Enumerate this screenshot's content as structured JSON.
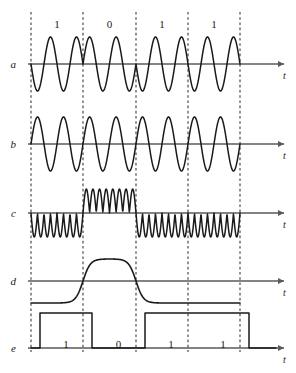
{
  "figure": {
    "title": "",
    "width": 296,
    "height": 373,
    "background": "#ffffff",
    "line_color": "#1a1a1a",
    "axis_color": "#5a5a5a",
    "dash_color": "#3a3a3a"
  },
  "timing": {
    "bit_labels": [
      "1",
      "0",
      "1",
      "1"
    ],
    "boundaries_x": [
      31,
      83,
      136,
      188,
      240
    ],
    "bit_label_y": 18,
    "axis_end_x": 284,
    "arrow_x": 278
  },
  "rows": [
    {
      "name": "a",
      "label": "a",
      "label_x": 14,
      "label_y": 58,
      "baseline_y": 64,
      "amplitude": 27,
      "t_label": "t",
      "t_x": 283,
      "t_y": 70,
      "kind": "psk",
      "cycles_per_bit": 2,
      "phases_deg": [
        180,
        0,
        180,
        180
      ]
    },
    {
      "name": "b",
      "label": "b",
      "label_x": 14,
      "label_y": 138,
      "baseline_y": 144,
      "amplitude": 27,
      "t_label": "t",
      "t_x": 283,
      "t_y": 150,
      "kind": "carrier",
      "cycles_per_bit": 2,
      "phase_deg": 0
    },
    {
      "name": "c",
      "label": "c",
      "label_x": 14,
      "label_y": 207,
      "baseline_y": 213,
      "amplitude": 24,
      "t_label": "t",
      "t_x": 283,
      "t_y": 219,
      "kind": "product",
      "cycles_per_bit": 2,
      "signs": [
        -1,
        1,
        -1,
        -1
      ]
    },
    {
      "name": "d",
      "label": "d",
      "label_x": 14,
      "label_y": 275,
      "baseline_y": 281,
      "amplitude": 22,
      "t_label": "t",
      "t_x": 283,
      "t_y": 287,
      "kind": "lowpass",
      "levels": [
        -1,
        1,
        -1,
        -1
      ],
      "edge_width": 14
    },
    {
      "name": "e",
      "label": "e",
      "label_x": 14,
      "label_y": 342,
      "baseline_y": 348,
      "amplitude": 35,
      "t_label": "t",
      "t_x": 283,
      "t_y": 354,
      "kind": "digital",
      "levels": [
        1,
        0,
        1,
        1
      ],
      "inset": 9,
      "bit_text": [
        "1",
        "0",
        "1",
        "1"
      ],
      "bit_text_y": 338
    }
  ]
}
